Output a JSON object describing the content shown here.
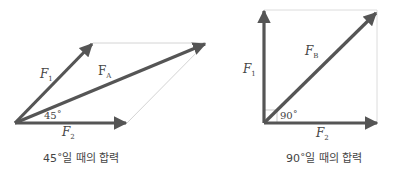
{
  "diagrams": [
    {
      "name": "resultant-45",
      "caption": "45˚일 때의 합력",
      "angle_label": "45˚",
      "vectors": {
        "f1": {
          "label": "F",
          "sub": "1"
        },
        "f2": {
          "label": "F",
          "sub": "2"
        },
        "resultant": {
          "label": "F",
          "sub": "A"
        }
      }
    },
    {
      "name": "resultant-90",
      "caption": "90˚일 때의 합력",
      "angle_label": "90˚",
      "vectors": {
        "f1": {
          "label": "F",
          "sub": "1"
        },
        "f2": {
          "label": "F",
          "sub": "2"
        },
        "resultant": {
          "label": "F",
          "sub": "B"
        }
      }
    }
  ],
  "colors": {
    "vector": "#555555",
    "guide": "#d0d0d0"
  }
}
